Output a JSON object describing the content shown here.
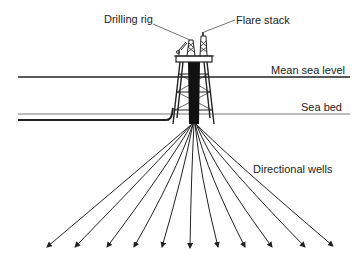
{
  "diagram": {
    "labels": {
      "drilling_rig": "Drilling rig",
      "flare_stack": "Flare stack",
      "mean_sea_level": "Mean sea level",
      "sea_bed": "Sea bed",
      "directional_wells": "Directional wells"
    },
    "well_count": 11,
    "colors": {
      "line": "#222222",
      "background": "#ffffff"
    }
  }
}
